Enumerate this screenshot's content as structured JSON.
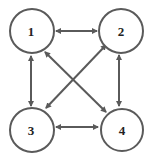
{
  "diagram": {
    "type": "graph",
    "directed": "bidirectional",
    "nodes": [
      {
        "id": "1",
        "label": "1",
        "cx": 32,
        "cy": 31
      },
      {
        "id": "2",
        "label": "2",
        "cx": 121,
        "cy": 31
      },
      {
        "id": "3",
        "label": "3",
        "cx": 32,
        "cy": 130
      },
      {
        "id": "4",
        "label": "4",
        "cx": 122,
        "cy": 130
      }
    ],
    "edges": [
      {
        "from": "1",
        "to": "2",
        "bidirectional": true
      },
      {
        "from": "1",
        "to": "3",
        "bidirectional": true
      },
      {
        "from": "1",
        "to": "4",
        "bidirectional": true
      },
      {
        "from": "2",
        "to": "3",
        "bidirectional": true
      },
      {
        "from": "2",
        "to": "4",
        "bidirectional": true
      },
      {
        "from": "3",
        "to": "4",
        "bidirectional": true
      }
    ],
    "colors": {
      "stroke": "#5a5a5a",
      "background": "#ffffff",
      "text": "#222222"
    }
  }
}
